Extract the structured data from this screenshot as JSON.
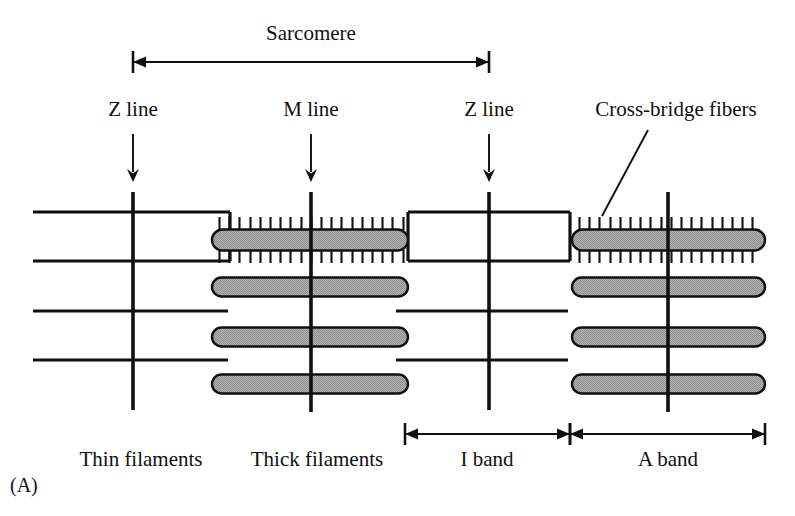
{
  "figure": {
    "panel_label": "(A)",
    "title_label": "Sarcomere",
    "top_labels": [
      {
        "id": "z-line-left",
        "text": "Z line",
        "x": 133,
        "y": 116,
        "anchor": "middle"
      },
      {
        "id": "m-line",
        "text": "M line",
        "x": 311,
        "y": 116,
        "anchor": "middle"
      },
      {
        "id": "z-line-right",
        "text": "Z line",
        "x": 489,
        "y": 116,
        "anchor": "middle"
      },
      {
        "id": "cross-bridge-fibers",
        "text": "Cross-bridge fibers",
        "x": 676,
        "y": 116,
        "anchor": "middle"
      }
    ],
    "bottom_labels": [
      {
        "id": "thin-filaments",
        "text": "Thin filaments",
        "x": 141,
        "y": 466,
        "anchor": "middle"
      },
      {
        "id": "thick-filaments",
        "text": "Thick filaments",
        "x": 317,
        "y": 466,
        "anchor": "middle"
      },
      {
        "id": "i-band",
        "text": "I band",
        "x": 487,
        "y": 466,
        "anchor": "middle"
      },
      {
        "id": "a-band",
        "text": "A band",
        "x": 668,
        "y": 466,
        "anchor": "middle"
      }
    ],
    "panel_label_pos": {
      "x": 10,
      "y": 492
    }
  },
  "diagram_data": {
    "type": "schematic-diagram",
    "subject": "skeletal muscle sarcomere ultrastructure",
    "colors": {
      "ink": "#101010",
      "thick_filament_fill": "#a9a9a9",
      "background": "#ffffff"
    },
    "vertical_markers": [
      {
        "id": "z-line-left",
        "name": "Z line",
        "x": 133,
        "y_top": 192,
        "y_bottom": 410
      },
      {
        "id": "m-line-left",
        "name": "M line",
        "x": 311,
        "y_top": 192,
        "y_bottom": 412
      },
      {
        "id": "z-line-right",
        "name": "Z line",
        "x": 489,
        "y_top": 192,
        "y_bottom": 410
      },
      {
        "id": "m-line-right",
        "name": "M line",
        "x": 668,
        "y_top": 192,
        "y_bottom": 412
      }
    ],
    "thin_filaments": [
      {
        "id": "thin-1",
        "y": 212,
        "x_start": 33,
        "x_end": 230
      },
      {
        "id": "thin-2",
        "y": 261,
        "x_start": 33,
        "x_end": 230
      },
      {
        "id": "thin-3",
        "y": 311,
        "x_start": 33,
        "x_end": 228
      },
      {
        "id": "thin-4",
        "y": 360,
        "x_start": 33,
        "x_end": 228
      },
      {
        "id": "thin-5",
        "y": 212,
        "x_start": 408,
        "x_end": 570
      },
      {
        "id": "thin-6",
        "y": 261,
        "x_start": 408,
        "x_end": 570
      },
      {
        "id": "thin-7",
        "y": 311,
        "x_start": 396,
        "x_end": 568
      },
      {
        "id": "thin-8",
        "y": 360,
        "x_start": 396,
        "x_end": 568
      }
    ],
    "connectors": [
      {
        "id": "connector-left-inner",
        "x": 230,
        "y_top": 212,
        "y_bottom": 261
      },
      {
        "id": "connector-left-outer",
        "x": 408,
        "y_top": 212,
        "y_bottom": 261
      },
      {
        "id": "connector-right-inner",
        "x": 570,
        "y_top": 212,
        "y_bottom": 261
      }
    ],
    "thick_filaments": [
      {
        "id": "thick-1",
        "y_center": 240,
        "x_start": 212,
        "x_end": 408,
        "height": 21,
        "has_cross_bridges": true
      },
      {
        "id": "thick-2",
        "y_center": 287,
        "x_start": 212,
        "x_end": 408,
        "height": 19,
        "has_cross_bridges": false
      },
      {
        "id": "thick-3",
        "y_center": 337,
        "x_start": 212,
        "x_end": 408,
        "height": 19,
        "has_cross_bridges": false
      },
      {
        "id": "thick-4",
        "y_center": 384,
        "x_start": 212,
        "x_end": 408,
        "height": 19,
        "has_cross_bridges": false
      },
      {
        "id": "thick-5",
        "y_center": 240,
        "x_start": 572,
        "x_end": 765,
        "height": 21,
        "has_cross_bridges": true
      },
      {
        "id": "thick-6",
        "y_center": 287,
        "x_start": 572,
        "x_end": 765,
        "height": 19,
        "has_cross_bridges": false
      },
      {
        "id": "thick-7",
        "y_center": 337,
        "x_start": 572,
        "x_end": 765,
        "height": 19,
        "has_cross_bridges": false
      },
      {
        "id": "thick-8",
        "y_center": 384,
        "x_start": 572,
        "x_end": 765,
        "height": 19,
        "has_cross_bridges": false
      }
    ],
    "cross_bridge_spikes": {
      "spacing": 10.2,
      "length": 13,
      "groups": [
        {
          "id": "spikes-left",
          "x_start": 219,
          "x_end": 404,
          "y_center": 240,
          "half_height": 10
        },
        {
          "id": "spikes-right",
          "x_start": 579,
          "x_end": 761,
          "y_center": 240,
          "half_height": 10
        }
      ]
    },
    "measures": [
      {
        "id": "sarcomere-measure",
        "label": "Sarcomere",
        "y": 62,
        "x_start": 133,
        "x_end": 489,
        "cap_half": 11,
        "double_headed": true
      },
      {
        "id": "i-band-measure",
        "label": "I band",
        "y": 434,
        "x_start": 405,
        "x_end": 570,
        "cap_half": 11,
        "double_headed": false
      },
      {
        "id": "a-band-measure",
        "label": "A band",
        "y": 434,
        "x_start": 570,
        "x_end": 765,
        "cap_half": 11,
        "double_headed": false
      }
    ],
    "pointer_arrows": [
      {
        "id": "pointer-z-left",
        "x": 133,
        "y_start": 134,
        "y_end": 182
      },
      {
        "id": "pointer-m-line",
        "x": 311,
        "y_start": 134,
        "y_end": 182
      },
      {
        "id": "pointer-z-right",
        "x": 489,
        "y_start": 134,
        "y_end": 182
      }
    ],
    "leaders": [
      {
        "id": "leader-cross-bridge",
        "x1": 648,
        "y1": 130,
        "x2": 602,
        "y2": 216
      }
    ]
  }
}
